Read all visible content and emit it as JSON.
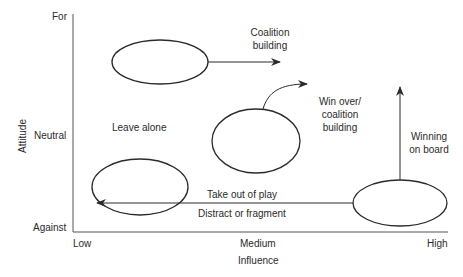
{
  "diagram": {
    "y_axis": {
      "title": "Attitude",
      "ticks": [
        "For",
        "Neutral",
        "Against"
      ]
    },
    "x_axis": {
      "title": "Influence",
      "ticks": [
        "Low",
        "Medium",
        "High"
      ]
    },
    "annotations": {
      "coalition_line1": "Coalition",
      "coalition_line2": "building",
      "leave_alone": "Leave alone",
      "win_over_line1": "Win over/",
      "win_over_line2": "coalition",
      "win_over_line3": "building",
      "winning_line1": "Winning",
      "winning_line2": "on board",
      "take_out": "Take out of play",
      "distract": "Distract or fragment"
    },
    "colors": {
      "line": "#2a2a2a",
      "text": "#2a2a2a",
      "background": "#ffffff"
    }
  }
}
